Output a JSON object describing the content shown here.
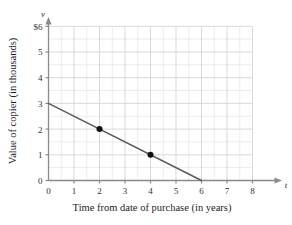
{
  "chart_data": {
    "type": "line",
    "title": "",
    "subtitle": "",
    "xlabel": "Time from date of purchase (in years)",
    "ylabel": "Value of copier (in thousands)",
    "x_axis_variable": "t",
    "y_axis_variable": "v",
    "xlim": [
      0,
      8
    ],
    "ylim": [
      0,
      6
    ],
    "xticks": [
      "0",
      "1",
      "2",
      "3",
      "4",
      "5",
      "6",
      "7",
      "8"
    ],
    "yticks": [
      "0",
      "1",
      "2",
      "3",
      "4",
      "5",
      "$6"
    ],
    "ytick_values": [
      0,
      1,
      2,
      3,
      4,
      5,
      6
    ],
    "xtick_values": [
      0,
      1,
      2,
      3,
      4,
      5,
      6,
      7,
      8
    ],
    "grid": true,
    "grid_minor_step": 0.5,
    "grid_major_step": 1,
    "legend": "none",
    "annotations": [],
    "series": [
      {
        "name": "Copier value",
        "kind": "line",
        "x": [
          0,
          6
        ],
        "y": [
          3,
          0
        ],
        "slope": -0.5,
        "intercept": 3,
        "color": "#595959",
        "line_width": 1.4,
        "markers": [
          {
            "x": 2,
            "y": 2,
            "label": ""
          },
          {
            "x": 4,
            "y": 1,
            "label": ""
          }
        ],
        "marker_color": "#111111",
        "marker_radius": 3
      }
    ],
    "colors": {
      "line": "#595959",
      "marker": "#111111",
      "axis": "#8a8a8a",
      "grid_major": "#d9d9d9",
      "grid_minor": "#ececec",
      "text": "#222222",
      "background": "#ffffff"
    }
  }
}
